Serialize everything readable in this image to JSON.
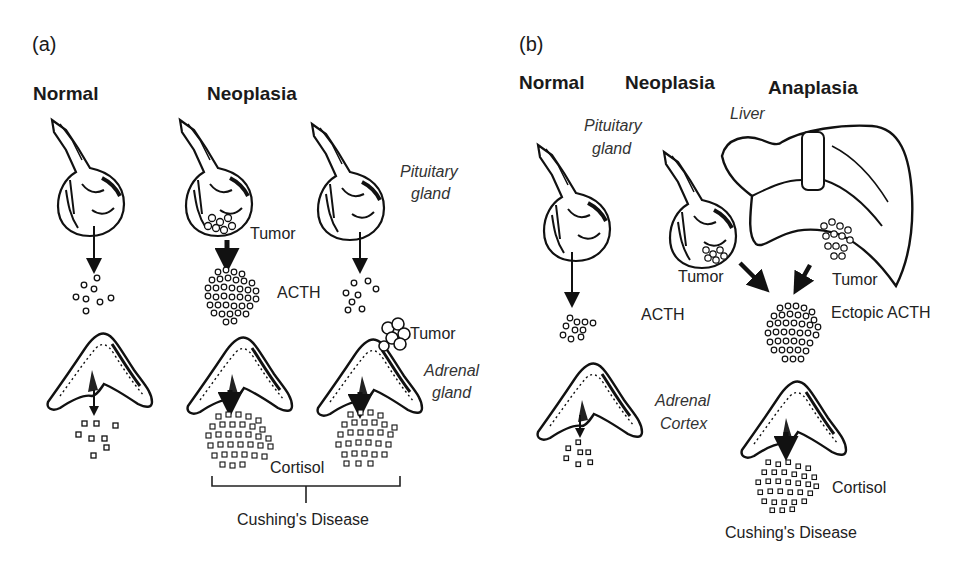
{
  "figure": {
    "panel_a": {
      "label": "(a)",
      "headings": {
        "normal": "Normal",
        "neoplasia": "Neoplasia"
      },
      "labels": {
        "tumor_pituitary": "Tumor",
        "acth": "ACTH",
        "pituitary_gland_1": "Pituitary",
        "pituitary_gland_2": "gland",
        "tumor_adrenal": "Tumor",
        "adrenal_gland_1": "Adrenal",
        "adrenal_gland_2": "gland",
        "cortisol": "Cortisol",
        "disease": "Cushing's Disease"
      }
    },
    "panel_b": {
      "label": "(b)",
      "headings": {
        "normal": "Normal",
        "neoplasia": "Neoplasia",
        "anaplasia": "Anaplasia"
      },
      "labels": {
        "pituitary_gland_1": "Pituitary",
        "pituitary_gland_2": "gland",
        "liver": "Liver",
        "tumor_pituitary": "Tumor",
        "tumor_liver": "Tumor",
        "acth": "ACTH",
        "ectopic_acth": "Ectopic ACTH",
        "adrenal_cortex_1": "Adrenal",
        "adrenal_cortex_2": "Cortex",
        "cortisol": "Cortisol",
        "disease": "Cushing's Disease"
      }
    },
    "colors": {
      "ink": "#1a1a1a",
      "background": "#ffffff"
    }
  }
}
